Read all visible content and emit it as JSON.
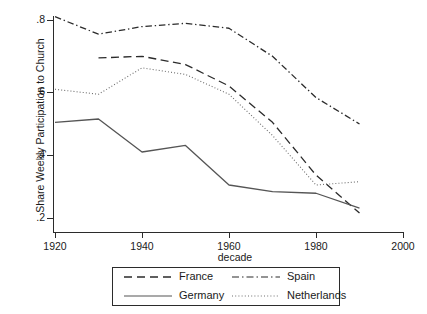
{
  "chart_data": {
    "type": "line",
    "title": "",
    "xlabel": "decade",
    "ylabel": "Share Weekly Participation to Church",
    "xlim": [
      1920,
      2000
    ],
    "ylim": [
      0.16,
      0.83
    ],
    "xticks": [
      1920,
      1940,
      1960,
      1980,
      2000
    ],
    "xticklabels": [
      "1920",
      "1940",
      "1960",
      "1980",
      "2000"
    ],
    "yticks": [
      0.2,
      0.4,
      0.6,
      0.8
    ],
    "yticklabels": [
      ".2",
      ".4",
      ".6",
      ".8"
    ],
    "grid": false,
    "legend_position": "below-center",
    "series": [
      {
        "name": "France",
        "style": "dashed",
        "color": "#2b2b2b",
        "x": [
          1930,
          1940,
          1950,
          1960,
          1970,
          1980,
          1990
        ],
        "y": [
          0.685,
          0.69,
          0.665,
          0.6,
          0.49,
          0.33,
          0.215
        ]
      },
      {
        "name": "Germany",
        "style": "solid",
        "color": "#555555",
        "x": [
          1920,
          1930,
          1940,
          1950,
          1960,
          1970,
          1980,
          1990
        ],
        "y": [
          0.49,
          0.5,
          0.4,
          0.42,
          0.3,
          0.28,
          0.275,
          0.23
        ]
      },
      {
        "name": "Spain",
        "style": "dash-dot",
        "color": "#2b2b2b",
        "x": [
          1920,
          1930,
          1940,
          1950,
          1960,
          1970,
          1980,
          1990
        ],
        "y": [
          0.81,
          0.757,
          0.78,
          0.79,
          0.775,
          0.69,
          0.565,
          0.485
        ]
      },
      {
        "name": "Netherlands",
        "style": "dotted",
        "color": "#6e6e6e",
        "x": [
          1920,
          1930,
          1940,
          1950,
          1960,
          1970,
          1980,
          1990
        ],
        "y": [
          0.59,
          0.575,
          0.655,
          0.635,
          0.575,
          0.45,
          0.3,
          0.31
        ]
      }
    ],
    "legend": [
      {
        "label": "France",
        "style": "dashed"
      },
      {
        "label": "Spain",
        "style": "dash-dot"
      },
      {
        "label": "Germany",
        "style": "solid"
      },
      {
        "label": "Netherlands",
        "style": "dotted"
      }
    ]
  }
}
